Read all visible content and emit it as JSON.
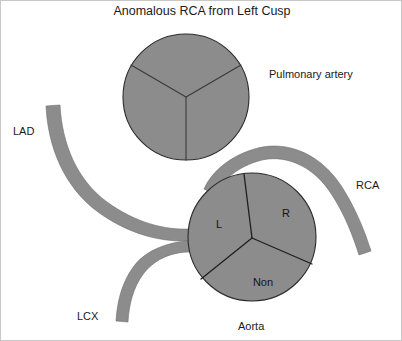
{
  "figure": {
    "title": "Anomalous RCA from Left Cusp",
    "background_color": "#ffffff",
    "fill_color": "#8c8c8c",
    "outline_color": "#2b2b2b",
    "text_color": "#1a1a1a"
  },
  "labels": {
    "pulmonary_artery": "Pulmonary artery",
    "aorta": "Aorta",
    "lad": "LAD",
    "lcx": "LCX",
    "rca": "RCA"
  },
  "aortic_cusps": [
    {
      "id": "left",
      "label": "L"
    },
    {
      "id": "right",
      "label": "R"
    },
    {
      "id": "non",
      "label": "Non"
    }
  ],
  "structures": {
    "pulmonary_artery": {
      "name": "Pulmonary artery",
      "shape": "circle",
      "leaflets": 3,
      "cx": 185,
      "cy": 96,
      "r": 63
    },
    "aortic_root": {
      "name": "Aorta",
      "shape": "circle",
      "leaflets": 3,
      "cx": 251,
      "cy": 236,
      "r": 64
    }
  },
  "vessels": [
    {
      "id": "lad",
      "name": "LAD",
      "origin": "left cusp"
    },
    {
      "id": "lcx",
      "name": "LCX",
      "origin": "left cusp"
    },
    {
      "id": "rca",
      "name": "RCA",
      "origin": "left cusp",
      "course": "anomalous, interarterial over aorta"
    }
  ]
}
